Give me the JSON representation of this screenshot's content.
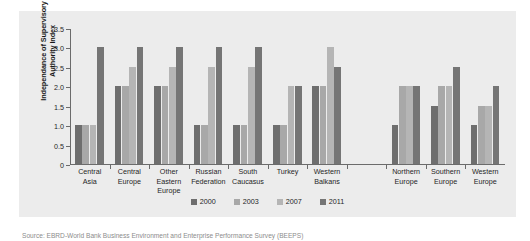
{
  "figure": {
    "top_cut_text": "",
    "caption": "Source: EBRD-World Bank Business Environment and Enterprise Performance Survey (BEEPS)"
  },
  "chart_data": {
    "type": "bar",
    "title": "",
    "xlabel": "",
    "ylabel": "Independance of Supervisory Authority Index",
    "ylim": [
      0,
      3.5
    ],
    "yticks": [
      "0",
      "0.5",
      "1.0",
      "1.5",
      "2.0",
      "2.5",
      "3.0",
      "3.5"
    ],
    "ytick_values": [
      0,
      0.5,
      1.0,
      1.5,
      2.0,
      2.5,
      3.0,
      3.5
    ],
    "grid": false,
    "legend_position": "bottom",
    "categories": [
      "Central Asia",
      "Central Europe",
      "Other Eastern Europe",
      "Russian Federation",
      "South Caucasus",
      "Turkey",
      "Western Balkans",
      "",
      "Northern Europe",
      "Southern Europe",
      "Western Europe"
    ],
    "category_lines": [
      [
        "Central",
        "Asia"
      ],
      [
        "Central",
        "Europe"
      ],
      [
        "Other",
        "Eastern",
        "Europe"
      ],
      [
        "Russian",
        "Federation"
      ],
      [
        "South",
        "Caucasus"
      ],
      [
        "Turkey"
      ],
      [
        "Western",
        "Balkans"
      ],
      [
        ""
      ],
      [
        "Northern",
        "Europe"
      ],
      [
        "Southern",
        "Europe"
      ],
      [
        "Western",
        "Europe"
      ]
    ],
    "series": [
      {
        "name": "2000",
        "color": "#6e6e6e",
        "values": [
          1.0,
          2.0,
          2.0,
          1.0,
          1.0,
          1.0,
          2.0,
          null,
          1.0,
          1.5,
          1.0
        ]
      },
      {
        "name": "2003",
        "color": "#a8a8a8",
        "values": [
          1.0,
          2.0,
          2.0,
          1.0,
          1.0,
          1.0,
          2.0,
          null,
          2.0,
          2.0,
          1.5
        ]
      },
      {
        "name": "2007",
        "color": "#b5b5b5",
        "values": [
          1.0,
          2.5,
          2.5,
          2.5,
          2.5,
          2.0,
          3.0,
          null,
          2.0,
          2.0,
          1.5
        ]
      },
      {
        "name": "2011",
        "color": "#757575",
        "values": [
          3.0,
          3.0,
          3.0,
          3.0,
          3.0,
          2.0,
          2.5,
          null,
          2.0,
          2.5,
          2.0
        ]
      }
    ]
  },
  "legend": {
    "items": [
      {
        "label": "2000",
        "color": "#6e6e6e"
      },
      {
        "label": "2003",
        "color": "#a8a8a8"
      },
      {
        "label": "2007",
        "color": "#b5b5b5"
      },
      {
        "label": "2011",
        "color": "#757575"
      }
    ]
  },
  "colors": {
    "panel_background": "#ececec",
    "axis": "#6b6b6b",
    "text": "#262626"
  }
}
